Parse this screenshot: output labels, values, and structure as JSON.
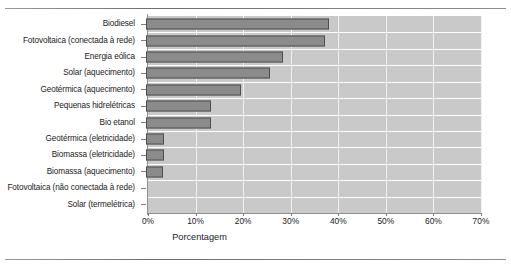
{
  "figure": {
    "top_rule": "horizontal-rule",
    "bottom_rule": "horizontal-rule"
  },
  "chart_data": {
    "type": "bar",
    "orientation": "horizontal",
    "title": "",
    "xlabel": "Porcentagem",
    "ylabel": "",
    "xlim": [
      0,
      70
    ],
    "xunit": "%",
    "grid": true,
    "legend": "none",
    "xticks": [
      0,
      10,
      20,
      30,
      40,
      50,
      60,
      70
    ],
    "xticklabels": [
      "0%",
      "10%",
      "20%",
      "30%",
      "40%",
      "50%",
      "60%",
      "70%"
    ],
    "categories": [
      "Biodiesel",
      "Fotovoltaica (conectada à rede)",
      "Energia eólica",
      "Solar (aquecimento)",
      "Geotérmica (aquecimento)",
      "Pequenas hidrelétricas",
      "Bio etanol",
      "Geotérmica (eletricidade)",
      "Biomassa (eletricidade)",
      "Biomassa (aquecimento)",
      "Fotovoltaica (não conectada à rede)",
      "Solar (termelétrica)"
    ],
    "values": [
      38.5,
      37.6,
      28.8,
      26.0,
      20.0,
      13.7,
      13.7,
      3.8,
      3.8,
      3.5,
      0,
      0
    ],
    "colors": {
      "bar_fill": "#8b8b8b",
      "bar_edge": "#4e4e4e",
      "plot_background": "#c9c9c9",
      "gridline": "#f2f2f2",
      "rowline": "#ffffff",
      "axis": "#8f8f8f",
      "text": "#1b1b1b"
    }
  }
}
